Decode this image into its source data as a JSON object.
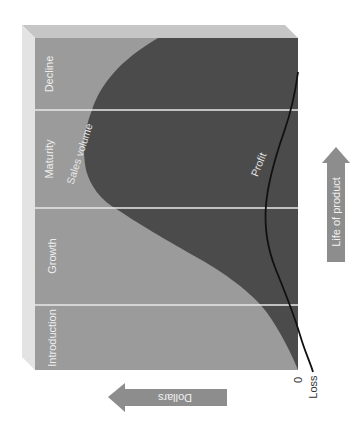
{
  "diagram": {
    "orientation": "rotated 90 degrees clockwise",
    "stages": [
      {
        "label": "Introduction"
      },
      {
        "label": "Growth"
      },
      {
        "label": "Maturity"
      },
      {
        "label": "Decline"
      }
    ],
    "curves": {
      "sales": {
        "label": "Sales volume"
      },
      "profit": {
        "label": "Profit"
      }
    },
    "axes": {
      "zero_label": "0",
      "loss_label": "Loss",
      "y_arrow_label": "Dollars",
      "x_arrow_label": "Life of product"
    },
    "colors": {
      "stage_bg": "#9a9a9a",
      "sales_area": "#4a4a4a",
      "profit_line": "#111111",
      "bevel_top": "#c4c4c4",
      "bevel_side": "#e2e2e2",
      "divider": "#e8e8e8",
      "arrow": "#8c8c8c"
    }
  }
}
